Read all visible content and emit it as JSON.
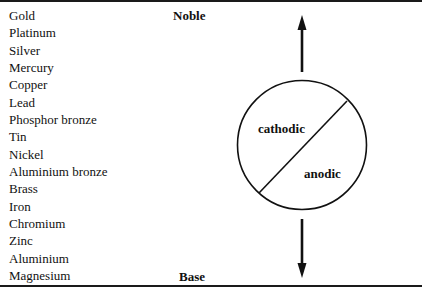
{
  "figure": {
    "metals": [
      "Gold",
      "Platinum",
      "Silver",
      "Mercury",
      "Copper",
      "Lead",
      "Phosphor bronze",
      "Tin",
      "Nickel",
      "Aluminium bronze",
      "Brass",
      "Iron",
      "Chromium",
      "Zinc",
      "Aluminium",
      "Magnesium"
    ],
    "top_label": "Noble",
    "bottom_label": "Base",
    "circle": {
      "upper_left_label": "cathodic",
      "lower_right_label": "anodic"
    },
    "arrows": [
      "up-arrow",
      "down-arrow"
    ],
    "line_color": "#111111"
  }
}
